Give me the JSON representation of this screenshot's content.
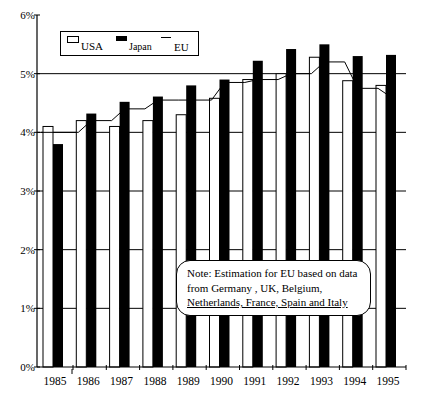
{
  "chart_data": {
    "type": "bar",
    "title": "",
    "xlabel": "",
    "ylabel": "",
    "categories": [
      "1985",
      "1986",
      "1987",
      "1988",
      "1989",
      "1990",
      "1991",
      "1992",
      "1993",
      "1994",
      "1995"
    ],
    "series": [
      {
        "name": "USA",
        "kind": "bar",
        "fill": "#ffffff",
        "values": [
          4.1,
          4.2,
          4.1,
          4.2,
          4.3,
          4.58,
          4.9,
          5.0,
          5.28,
          4.88,
          4.8
        ]
      },
      {
        "name": "Japan",
        "kind": "bar",
        "fill": "#000000",
        "values": [
          3.8,
          4.32,
          4.52,
          4.61,
          4.8,
          4.9,
          5.22,
          5.42,
          5.5,
          5.3,
          5.32
        ]
      },
      {
        "name": "EU",
        "kind": "line",
        "color": "#000000",
        "values": [
          4.0,
          4.2,
          4.4,
          4.55,
          4.55,
          4.85,
          4.9,
          5.0,
          5.2,
          4.75,
          4.6
        ]
      }
    ],
    "yticks": [
      "0%",
      "1%",
      "2%",
      "3%",
      "4%",
      "5%",
      "6%"
    ],
    "ylim": [
      0,
      6
    ],
    "grid": true,
    "legend": {
      "position": "top-left",
      "entries": [
        "USA",
        "Japan",
        "EU"
      ]
    },
    "annotations": [
      "Note: Estimation for EU based on data from Germany , UK, Belgium, Netherlands, France, Spain and Italy"
    ]
  },
  "legend": {
    "usa": "USA",
    "japan": "Japan",
    "eu": "EU"
  },
  "note": {
    "line1": "Note: Estimation for EU based on data",
    "line2": "from Germany , UK, Belgium,",
    "line3": "Netherlands, France, Spain and Italy"
  }
}
